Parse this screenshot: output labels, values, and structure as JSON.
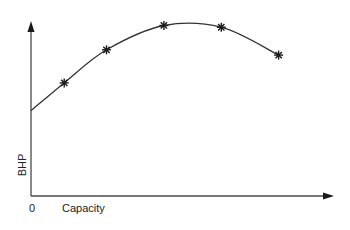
{
  "chart_data": {
    "type": "line",
    "title": "",
    "xlabel": "Capacity",
    "ylabel": "BHP",
    "x_origin_label": "0",
    "grid": false,
    "legend": null,
    "axis_ticks": false,
    "series": [
      {
        "name": "BHP vs Capacity",
        "marker": "asterisk",
        "curve_start": {
          "x": 0,
          "y": 0.49
        },
        "points": [
          {
            "x": 0.11,
            "y": 0.65
          },
          {
            "x": 0.25,
            "y": 0.84
          },
          {
            "x": 0.44,
            "y": 0.98
          },
          {
            "x": 0.63,
            "y": 0.97
          },
          {
            "x": 0.82,
            "y": 0.81
          }
        ]
      }
    ]
  },
  "colors": {
    "axis": "#4a4a4a",
    "curve": "#333333",
    "marker": "#1a1a1a",
    "text": "#222222",
    "background": "#ffffff"
  }
}
